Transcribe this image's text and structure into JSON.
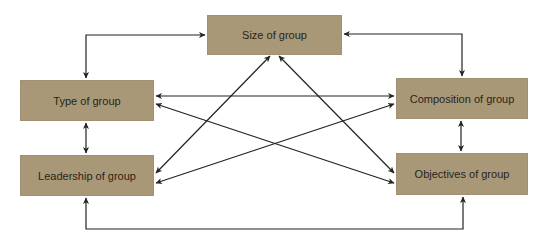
{
  "diagram": {
    "type": "relationship-network",
    "colors": {
      "box_fill": "#a89878",
      "text": "#2a2418",
      "arrow": "#222222",
      "background": "#ffffff"
    },
    "nodes": {
      "size": {
        "label": "Size of group"
      },
      "type": {
        "label": "Type of group"
      },
      "composition": {
        "label": "Composition of group"
      },
      "leadership": {
        "label": "Leadership of group"
      },
      "objectives": {
        "label": "Objectives of group"
      }
    },
    "edges": [
      {
        "from": "Size of group",
        "to": "Type of group",
        "style": "elbow",
        "bidirectional": true
      },
      {
        "from": "Size of group",
        "to": "Composition of group",
        "style": "elbow",
        "bidirectional": true
      },
      {
        "from": "Type of group",
        "to": "Leadership of group",
        "style": "straight",
        "bidirectional": true
      },
      {
        "from": "Composition of group",
        "to": "Objectives of group",
        "style": "straight",
        "bidirectional": true
      },
      {
        "from": "Leadership of group",
        "to": "Objectives of group",
        "style": "elbow",
        "bidirectional": true
      },
      {
        "from": "Type of group",
        "to": "Composition of group",
        "style": "straight",
        "bidirectional": true
      },
      {
        "from": "Type of group",
        "to": "Objectives of group",
        "style": "diagonal",
        "bidirectional": true
      },
      {
        "from": "Leadership of group",
        "to": "Size of group",
        "style": "diagonal",
        "bidirectional": true
      },
      {
        "from": "Leadership of group",
        "to": "Composition of group",
        "style": "diagonal",
        "bidirectional": true
      },
      {
        "from": "Size of group",
        "to": "Objectives of group",
        "style": "diagonal",
        "bidirectional": true
      }
    ]
  }
}
